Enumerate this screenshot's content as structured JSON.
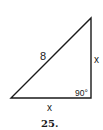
{
  "figure": {
    "number": "25.",
    "hypotenuse_label": "8",
    "vertical_leg_label": "x",
    "horizontal_leg_label": "x",
    "right_angle_label": "90°"
  },
  "colors": {
    "stroke": "#1a1a1a",
    "background": "#ffffff"
  }
}
